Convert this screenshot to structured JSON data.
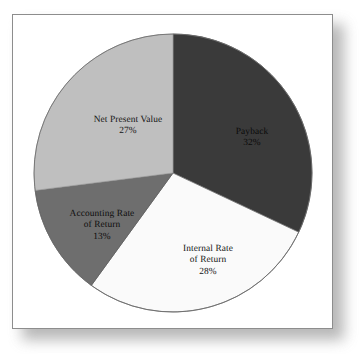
{
  "figure": {
    "frame_border_color": "#8d8d8d",
    "background_color": "#ffffff",
    "shadow_color": "#9d9d9d"
  },
  "chart_data": {
    "type": "pie",
    "title": "",
    "subtitle": "",
    "xlabel": "",
    "ylabel": "",
    "grid": false,
    "legend_position": "none",
    "labels_inside_slices": true,
    "start_angle_deg": 0,
    "direction": "clockwise",
    "units": "percent",
    "total": 100,
    "categories": [
      "Payback",
      "Internal Rate of Return",
      "Accounting Rate of Return",
      "Net Present Value"
    ],
    "values": [
      32,
      28,
      13,
      27
    ],
    "slices": [
      {
        "name": "Payback",
        "label_lines": [
          "Payback"
        ],
        "value": 32,
        "value_text": "32%",
        "color": "#3a3a3a",
        "text_color": "#0a0a0a",
        "start_deg": 0,
        "end_deg": 115.2
      },
      {
        "name": "Internal Rate of Return",
        "label_lines": [
          "Internal Rate",
          "of Return"
        ],
        "value": 28,
        "value_text": "28%",
        "color": "#fafafa",
        "text_color": "#141414",
        "start_deg": 115.2,
        "end_deg": 216.0
      },
      {
        "name": "Accounting Rate of Return",
        "label_lines": [
          "Accounting Rate",
          "of Return"
        ],
        "value": 13,
        "value_text": "13%",
        "color": "#6e6e6e",
        "text_color": "#0d0d0d",
        "start_deg": 216.0,
        "end_deg": 262.8
      },
      {
        "name": "Net Present Value",
        "label_lines": [
          "Net Present Value"
        ],
        "value": 27,
        "value_text": "27%",
        "color": "#bfbfbf",
        "text_color": "#0d0d0d",
        "start_deg": 262.8,
        "end_deg": 360.0
      }
    ],
    "outline_color": "#6a6a6a"
  },
  "labels": {
    "payback": {
      "name": "Payback",
      "percent": "32%"
    },
    "net_present_value": {
      "name": "Net Present Value",
      "percent": "27%"
    },
    "internal_rate_of_return": {
      "line1": "Internal Rate",
      "line2": "of Return",
      "percent": "28%"
    },
    "accounting_rate_of_return": {
      "line1": "Accounting Rate",
      "line2": "of Return",
      "percent": "13%"
    }
  }
}
